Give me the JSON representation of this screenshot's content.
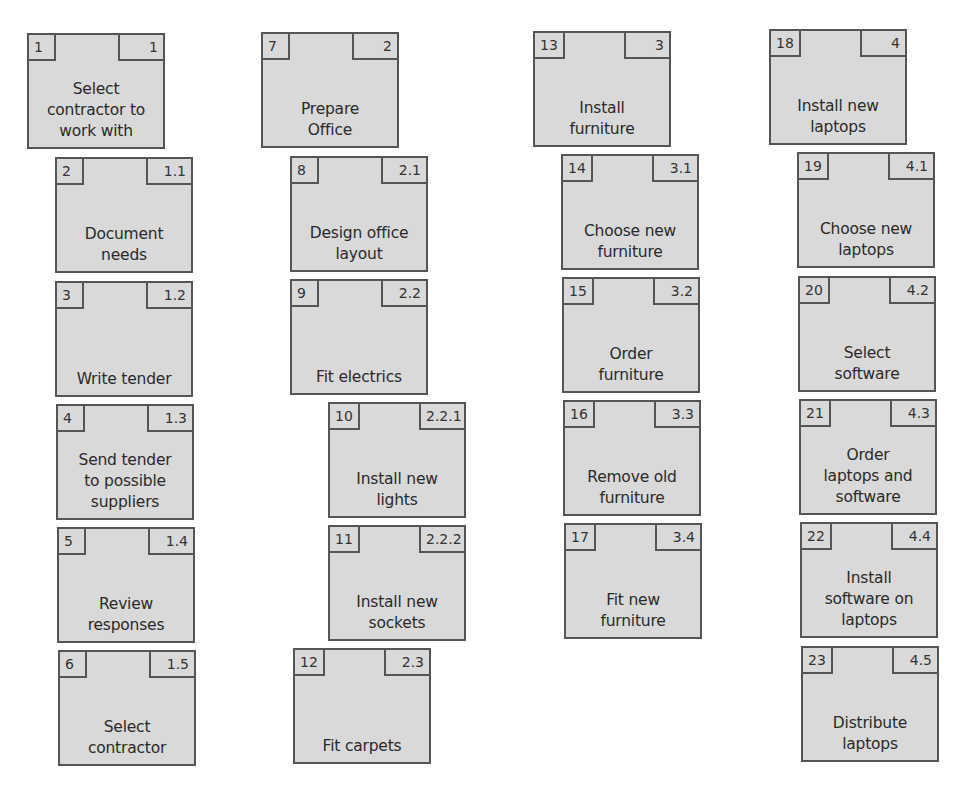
{
  "diagram": {
    "type": "work-breakdown-structure",
    "colors": {
      "box_fill": "#d9d9d9",
      "box_border": "#555555",
      "text": "#2a2a2a",
      "background": "#ffffff"
    },
    "columns": [
      {
        "branch": "1",
        "tasks": [
          {
            "id": "1",
            "wbs": "1",
            "label": "Select\ncontractor to\nwork with",
            "x": 27,
            "y": 33,
            "level": 1
          },
          {
            "id": "2",
            "wbs": "1.1",
            "label": "Document\nneeds",
            "x": 55,
            "y": 157,
            "level": 2
          },
          {
            "id": "3",
            "wbs": "1.2",
            "label": "Write tender",
            "x": 55,
            "y": 281,
            "level": 2
          },
          {
            "id": "4",
            "wbs": "1.3",
            "label": "Send tender\nto possible\nsuppliers",
            "x": 56,
            "y": 404,
            "level": 2
          },
          {
            "id": "5",
            "wbs": "1.4",
            "label": "Review\nresponses",
            "x": 57,
            "y": 527,
            "level": 2
          },
          {
            "id": "6",
            "wbs": "1.5",
            "label": "Select\ncontractor",
            "x": 58,
            "y": 650,
            "level": 2
          }
        ]
      },
      {
        "branch": "2",
        "tasks": [
          {
            "id": "7",
            "wbs": "2",
            "label": "Prepare\nOffice",
            "x": 261,
            "y": 32,
            "level": 1
          },
          {
            "id": "8",
            "wbs": "2.1",
            "label": "Design office\nlayout",
            "x": 290,
            "y": 156,
            "level": 2
          },
          {
            "id": "9",
            "wbs": "2.2",
            "label": "Fit electrics",
            "x": 290,
            "y": 279,
            "level": 2
          },
          {
            "id": "10",
            "wbs": "2.2.1",
            "label": "Install new\nlights",
            "x": 328,
            "y": 402,
            "level": 3
          },
          {
            "id": "11",
            "wbs": "2.2.2",
            "label": "Install new\nsockets",
            "x": 328,
            "y": 525,
            "level": 3
          },
          {
            "id": "12",
            "wbs": "2.3",
            "label": "Fit carpets",
            "x": 293,
            "y": 648,
            "level": 2
          }
        ]
      },
      {
        "branch": "3",
        "tasks": [
          {
            "id": "13",
            "wbs": "3",
            "label": "Install\nfurniture",
            "x": 533,
            "y": 31,
            "level": 1
          },
          {
            "id": "14",
            "wbs": "3.1",
            "label": "Choose new\nfurniture",
            "x": 561,
            "y": 154,
            "level": 2
          },
          {
            "id": "15",
            "wbs": "3.2",
            "label": "Order\nfurniture",
            "x": 562,
            "y": 277,
            "level": 2
          },
          {
            "id": "16",
            "wbs": "3.3",
            "label": "Remove old\nfurniture",
            "x": 563,
            "y": 400,
            "level": 2
          },
          {
            "id": "17",
            "wbs": "3.4",
            "label": "Fit new\nfurniture",
            "x": 564,
            "y": 523,
            "level": 2
          }
        ]
      },
      {
        "branch": "4",
        "tasks": [
          {
            "id": "18",
            "wbs": "4",
            "label": "Install new\nlaptops",
            "x": 769,
            "y": 29,
            "level": 1
          },
          {
            "id": "19",
            "wbs": "4.1",
            "label": "Choose new\nlaptops",
            "x": 797,
            "y": 152,
            "level": 2
          },
          {
            "id": "20",
            "wbs": "4.2",
            "label": "Select\nsoftware",
            "x": 798,
            "y": 276,
            "level": 2
          },
          {
            "id": "21",
            "wbs": "4.3",
            "label": "Order\nlaptops and\nsoftware",
            "x": 799,
            "y": 399,
            "level": 2
          },
          {
            "id": "22",
            "wbs": "4.4",
            "label": "Install\nsoftware on\nlaptops",
            "x": 800,
            "y": 522,
            "level": 2
          },
          {
            "id": "23",
            "wbs": "4.5",
            "label": "Distribute\nlaptops",
            "x": 801,
            "y": 646,
            "level": 2
          }
        ]
      }
    ]
  }
}
